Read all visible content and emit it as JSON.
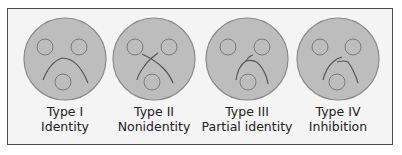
{
  "colors": {
    "frame_border": "#4a4a4a",
    "frame_background": "#f4f4f4",
    "circle_fill": "#bdbdbd",
    "circle_stroke": "#8a8a8a",
    "line_stroke": "#555555",
    "text": "#222222"
  },
  "panels": [
    {
      "type_label": "Type I",
      "description": "Identity"
    },
    {
      "type_label": "Type II",
      "description": "Nonidentity"
    },
    {
      "type_label": "Type III",
      "description": "Partial identity"
    },
    {
      "type_label": "Type IV",
      "description": "Inhibition"
    }
  ]
}
